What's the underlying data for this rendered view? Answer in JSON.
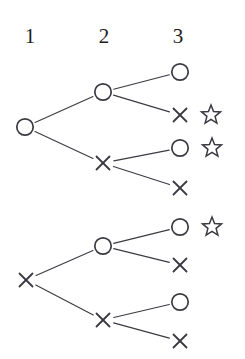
{
  "diagram": {
    "width": 245,
    "height": 359,
    "background": "#ffffff",
    "stroke_color": "#3a3a42",
    "text_color": "#1d1d1d",
    "columns": [
      {
        "label": "1",
        "x": 30,
        "y": 26
      },
      {
        "label": "2",
        "x": 104,
        "y": 26
      },
      {
        "label": "3",
        "x": 178,
        "y": 26
      }
    ],
    "glyphs": {
      "circle": "circle-node",
      "cross": "cross-node",
      "star": "star-marker"
    },
    "nodes": [
      {
        "id": "t1-n1",
        "type": "circle",
        "level": 1,
        "x": 25,
        "y": 127,
        "star": false
      },
      {
        "id": "t1-n2a",
        "type": "circle",
        "level": 2,
        "x": 103,
        "y": 92,
        "star": false
      },
      {
        "id": "t1-n2b",
        "type": "cross",
        "level": 2,
        "x": 103,
        "y": 163,
        "star": false
      },
      {
        "id": "t1-n3a",
        "type": "circle",
        "level": 3,
        "x": 180,
        "y": 72,
        "star": false
      },
      {
        "id": "t1-n3b",
        "type": "cross",
        "level": 3,
        "x": 180,
        "y": 115,
        "star": true
      },
      {
        "id": "t1-n3c",
        "type": "circle",
        "level": 3,
        "x": 180,
        "y": 148,
        "star": true
      },
      {
        "id": "t1-n3d",
        "type": "cross",
        "level": 3,
        "x": 180,
        "y": 188,
        "star": false
      },
      {
        "id": "t2-n1",
        "type": "cross",
        "level": 1,
        "x": 26,
        "y": 280,
        "star": false
      },
      {
        "id": "t2-n2a",
        "type": "circle",
        "level": 2,
        "x": 103,
        "y": 246,
        "star": false
      },
      {
        "id": "t2-n2b",
        "type": "cross",
        "level": 2,
        "x": 103,
        "y": 320,
        "star": false
      },
      {
        "id": "t2-n3a",
        "type": "circle",
        "level": 3,
        "x": 180,
        "y": 227,
        "star": true
      },
      {
        "id": "t2-n3b",
        "type": "cross",
        "level": 3,
        "x": 180,
        "y": 265,
        "star": false
      },
      {
        "id": "t2-n3c",
        "type": "circle",
        "level": 3,
        "x": 180,
        "y": 302,
        "star": false
      },
      {
        "id": "t2-n3d",
        "type": "cross",
        "level": 3,
        "x": 180,
        "y": 341,
        "star": false
      }
    ],
    "edges": [
      {
        "from": "t1-n1",
        "to": "t1-n2a"
      },
      {
        "from": "t1-n1",
        "to": "t1-n2b"
      },
      {
        "from": "t1-n2a",
        "to": "t1-n3a"
      },
      {
        "from": "t1-n2a",
        "to": "t1-n3b"
      },
      {
        "from": "t1-n2b",
        "to": "t1-n3c"
      },
      {
        "from": "t1-n2b",
        "to": "t1-n3d"
      },
      {
        "from": "t2-n1",
        "to": "t2-n2a"
      },
      {
        "from": "t2-n1",
        "to": "t2-n2b"
      },
      {
        "from": "t2-n2a",
        "to": "t2-n3a"
      },
      {
        "from": "t2-n2a",
        "to": "t2-n3b"
      },
      {
        "from": "t2-n2b",
        "to": "t2-n3c"
      },
      {
        "from": "t2-n2b",
        "to": "t2-n3d"
      }
    ],
    "stars": [
      {
        "for": "t1-n3b",
        "x": 211,
        "y": 115
      },
      {
        "for": "t1-n3c",
        "x": 212,
        "y": 148
      },
      {
        "for": "t2-n3a",
        "x": 212,
        "y": 227
      }
    ],
    "geometry": {
      "circle_radius": 8.2,
      "circle_stroke_width": 1.7,
      "cross_arm": 6.5,
      "cross_stroke_width": 1.8,
      "star_outer_radius": 10,
      "star_inner_radius": 4.3,
      "star_stroke_width": 1.5,
      "edge_stroke_width": 1.1,
      "node_gap": 11
    }
  }
}
